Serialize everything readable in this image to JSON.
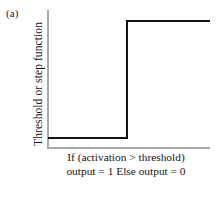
{
  "panel": {
    "label": "(a)"
  },
  "axes": {
    "y_title": "Threshold or step function",
    "axis_color": "#a9a9a9"
  },
  "caption": {
    "line1": "If (activation > threshold)",
    "line2": "output = 1 Else output = 0"
  },
  "chart_data": {
    "type": "line",
    "title": "",
    "subtitle": "",
    "xlabel": "",
    "ylabel": "Threshold or step function",
    "xlim": [
      0,
      1
    ],
    "ylim": [
      0,
      1
    ],
    "grid": false,
    "legend": null,
    "xticklabels": [],
    "yticklabels": [],
    "annotations": [
      "(a)",
      "If (activation > threshold)",
      "output = 1 Else output = 0"
    ],
    "series": [
      {
        "name": "Threshold (Heaviside step) function",
        "color": "#121212",
        "x": [
          0.0,
          0.49,
          0.49,
          1.0
        ],
        "values": [
          0.07,
          0.07,
          0.92,
          0.92
        ]
      }
    ]
  }
}
